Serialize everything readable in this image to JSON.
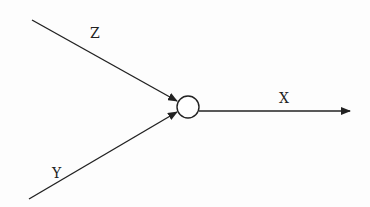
{
  "diagram": {
    "type": "signal-flow / summing junction",
    "node": {
      "shape": "circle",
      "label": ""
    },
    "inputs": [
      {
        "label": "Z",
        "direction": "into node from upper-left"
      },
      {
        "label": "Y",
        "direction": "into node from lower-left"
      }
    ],
    "output": {
      "label": "X",
      "direction": "out of node to the right"
    },
    "colors": {
      "stroke": "#222222",
      "background": "#fdfdfd"
    }
  }
}
